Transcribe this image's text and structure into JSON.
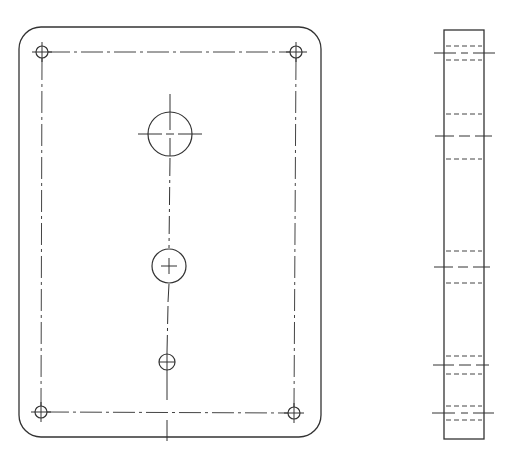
{
  "drawing": {
    "type": "orthographic-technical-drawing",
    "views": [
      "front-view",
      "side-view"
    ],
    "colors": {
      "background": "#ffffff",
      "line": "#333333"
    }
  },
  "front_view": {
    "outline": {
      "x": 19,
      "y": 27,
      "width": 302,
      "height": 410,
      "corner_radius": 22
    },
    "bolt_circle_rect": {
      "x1": 42,
      "y1": 52,
      "x2": 296,
      "y2": 413
    },
    "corner_holes": [
      {
        "name": "top-left",
        "cx": 42,
        "cy": 52,
        "r": 6
      },
      {
        "name": "top-right",
        "cx": 296,
        "cy": 52,
        "r": 6
      },
      {
        "name": "bottom-left",
        "cx": 41,
        "cy": 412,
        "r": 6
      },
      {
        "name": "bottom-right",
        "cx": 294,
        "cy": 413,
        "r": 6
      }
    ],
    "center_holes": [
      {
        "name": "large",
        "cx": 170,
        "cy": 134,
        "r": 22
      },
      {
        "name": "medium",
        "cx": 169,
        "cy": 266,
        "r": 17
      },
      {
        "name": "small",
        "cx": 167,
        "cy": 362,
        "r": 8
      }
    ],
    "vertical_centerline_x": 168
  },
  "side_view": {
    "outline": {
      "x": 444,
      "y": 30,
      "width": 40,
      "height": 409
    },
    "hole_sections": [
      {
        "name": "top-corner",
        "center_y": 53,
        "hidden_top": 46,
        "hidden_bottom": 60
      },
      {
        "name": "large",
        "center_y": 136,
        "hidden_top": 114,
        "hidden_bottom": 159
      },
      {
        "name": "medium",
        "center_y": 267,
        "hidden_top": 251,
        "hidden_bottom": 283
      },
      {
        "name": "small",
        "center_y": 365,
        "hidden_top": 356,
        "hidden_bottom": 374
      },
      {
        "name": "bottom-corner",
        "center_y": 413,
        "hidden_top": 406,
        "hidden_bottom": 420
      }
    ]
  }
}
